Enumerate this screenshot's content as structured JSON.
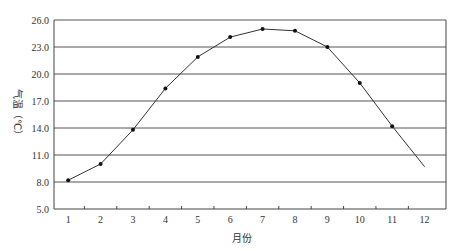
{
  "chart_data": {
    "type": "line",
    "title": "",
    "xlabel": "月份",
    "ylabel": "气温（℃）",
    "x": [
      1,
      2,
      3,
      4,
      5,
      6,
      7,
      8,
      9,
      10,
      11,
      12
    ],
    "categories": [
      "1",
      "2",
      "3",
      "4",
      "5",
      "6",
      "7",
      "8",
      "9",
      "10",
      "11",
      "12"
    ],
    "series": [
      {
        "name": "气温",
        "values": [
          8.2,
          10.0,
          13.8,
          18.4,
          21.9,
          24.1,
          25.0,
          24.8,
          23.0,
          19.0,
          14.2,
          9.7
        ],
        "markers": [
          true,
          true,
          true,
          true,
          true,
          true,
          true,
          true,
          true,
          true,
          true,
          false
        ]
      }
    ],
    "ylim": [
      5.0,
      26.0
    ],
    "yticks": [
      "5.0",
      "8.0",
      "11.0",
      "14.0",
      "17.0",
      "20.0",
      "23.0",
      "26.0"
    ],
    "ytick_values": [
      5,
      8,
      11,
      14,
      17,
      20,
      23,
      26
    ],
    "grid": "horizontal",
    "legend": "none",
    "colors": {
      "line": "#333333",
      "grid": "#555555",
      "text": "#333333"
    }
  }
}
